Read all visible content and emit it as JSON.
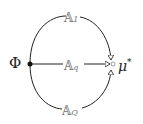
{
  "diagram": {
    "source_node": {
      "label": "Φ"
    },
    "target_node": {
      "label": "μ",
      "superscript": "*"
    },
    "paths": [
      {
        "label": "𝔸",
        "subscript": "1",
        "position": "top"
      },
      {
        "label": "𝔸",
        "subscript": "q",
        "position": "middle"
      },
      {
        "label": "𝔸",
        "subscript": "Q",
        "position": "bottom"
      }
    ],
    "colors": {
      "line": "#222222",
      "label": "#777777",
      "background": "#ffffff"
    }
  }
}
